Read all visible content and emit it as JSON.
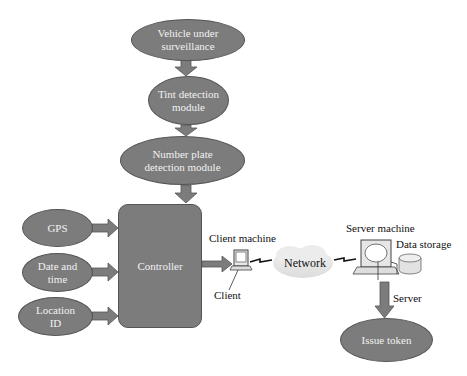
{
  "diagram": {
    "nodes": {
      "vehicle": {
        "label": "Vehicle under surveillance",
        "line1": "Vehicle under",
        "line2": "surveillance"
      },
      "tint": {
        "label": "Tint detection module",
        "line1": "Tint detection",
        "line2": "module"
      },
      "plate": {
        "label": "Number plate detection module",
        "line1": "Number plate",
        "line2": "detection module"
      },
      "gps": {
        "label": "GPS"
      },
      "datetime": {
        "label": "Date and time",
        "line1": "Date and",
        "line2": "time"
      },
      "location": {
        "label": "Location ID",
        "line1": "Location",
        "line2": "ID"
      },
      "controller": {
        "label": "Controller"
      },
      "issue_token": {
        "label": "Issue token"
      }
    },
    "labels": {
      "client_machine": "Client machine",
      "client": "Client",
      "network": "Network",
      "server_machine": "Server machine",
      "data_storage": "Data storage",
      "server": "Server"
    },
    "icons": [
      "computer-client-icon",
      "cloud-network-icon",
      "computer-server-icon",
      "database-icon"
    ],
    "edges": [
      [
        "Vehicle under surveillance",
        "Tint detection module"
      ],
      [
        "Tint detection module",
        "Number plate detection module"
      ],
      [
        "Number plate detection module",
        "Controller"
      ],
      [
        "GPS",
        "Controller"
      ],
      [
        "Date and time",
        "Controller"
      ],
      [
        "Location ID",
        "Controller"
      ],
      [
        "Controller",
        "Client machine"
      ],
      [
        "Client machine",
        "Network"
      ],
      [
        "Network",
        "Server machine"
      ],
      [
        "Server machine",
        "Issue token"
      ]
    ],
    "colors": {
      "node_fill": "#7c7c7c",
      "node_border": "#555555",
      "node_text": "#f2f2f2",
      "arrow_fill": "#7c7c7c"
    }
  }
}
